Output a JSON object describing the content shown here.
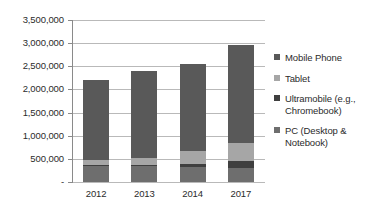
{
  "chart_data": {
    "type": "bar",
    "subtype": "stacked-column",
    "title": "",
    "xlabel": "",
    "ylabel": "",
    "categories": [
      "2012",
      "2013",
      "2014",
      "2017"
    ],
    "series": [
      {
        "name": "PC (Desktop & Notebook)",
        "color": "#6e6e6e",
        "values": [
          350000,
          340000,
          330000,
          300000
        ]
      },
      {
        "name": "Ultramobile (e.g., Chromebook)",
        "color": "#3f3f3f",
        "values": [
          10000,
          20000,
          60000,
          150000
        ]
      },
      {
        "name": "Tablet",
        "color": "#a6a6a6",
        "values": [
          120000,
          160000,
          270000,
          400000
        ]
      },
      {
        "name": "Mobile Phone",
        "color": "#595959",
        "values": [
          1730000,
          1880000,
          1890000,
          2100000
        ]
      }
    ],
    "totals": [
      2210000,
      2400000,
      2550000,
      2950000
    ],
    "ylim": [
      0,
      3500000
    ],
    "ytick_values": [
      0,
      500000,
      1000000,
      1500000,
      2000000,
      2500000,
      3000000,
      3500000
    ],
    "ytick_labels": [
      "-",
      "500,000",
      "1,000,000",
      "1,500,000",
      "2,000,000",
      "2,500,000",
      "3,000,000",
      "3,500,000"
    ],
    "grid": true,
    "legend_position": "right",
    "legend": [
      {
        "label": "Mobile Phone",
        "color": "#595959"
      },
      {
        "label": "Tablet",
        "color": "#a6a6a6"
      },
      {
        "label": "Ultramobile (e.g., Chromebook)",
        "color": "#3f3f3f"
      },
      {
        "label": "PC (Desktop & Notebook)",
        "color": "#6e6e6e"
      }
    ]
  },
  "colors": {
    "gridline": "#b9b9b9",
    "axis": "#8a8a8a",
    "text": "#2b2b2b",
    "background": "#ffffff"
  }
}
